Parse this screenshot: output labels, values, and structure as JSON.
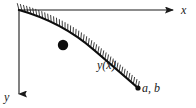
{
  "figure": {
    "background_color": "#ffffff",
    "ink_color": "#1a1a1a",
    "width": 196,
    "height": 108
  },
  "axes": {
    "x_axis": {
      "label": "x",
      "direction": "right",
      "arrow": true,
      "start": [
        19,
        10
      ],
      "end": [
        178,
        10
      ]
    },
    "y_axis": {
      "label": "y",
      "direction": "down",
      "arrow": true,
      "start": [
        19,
        10
      ],
      "end": [
        19,
        99
      ]
    },
    "origin": [
      19,
      10
    ]
  },
  "curve": {
    "label": "y(x)",
    "description": "concave-up descending track with hatching on the upper side",
    "start_point": [
      19,
      10
    ],
    "end_point": [
      138,
      88
    ],
    "hatching": true,
    "hatch_side": "above",
    "hatch_count": 46,
    "hatch_length": 7
  },
  "bead": {
    "label": "",
    "shape": "filled-circle",
    "center": [
      63,
      45
    ],
    "radius": 5.2,
    "color": "#0d0d0d"
  },
  "endpoint_marker": {
    "label": "a, b",
    "shape": "filled-dot",
    "center": [
      138,
      88
    ],
    "radius": 2.6,
    "color": "#0d0d0d"
  },
  "chart_data": {
    "type": "line",
    "title": "",
    "xlabel": "x",
    "ylabel": "y",
    "annotations": [
      "y(x)",
      "a, b"
    ],
    "x": [
      0,
      12,
      24,
      36,
      48,
      60,
      72,
      84,
      96,
      108,
      119
    ],
    "y": [
      0,
      18,
      33,
      45,
      55,
      63,
      70,
      75,
      79,
      81,
      78
    ],
    "axis_orientation": "y-down",
    "grid": false,
    "legend": "none"
  }
}
